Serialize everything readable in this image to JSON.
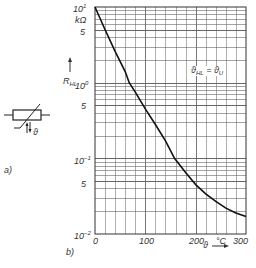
{
  "chart_data": {
    "type": "line",
    "title": "",
    "xlabel": "ϑ",
    "x_unit": "°C",
    "ylabel": "R_HL",
    "y_unit": "kΩ",
    "yscale": "log",
    "xlim": [
      0,
      300
    ],
    "ylim": [
      0.01,
      10
    ],
    "grid": true,
    "x_ticks": [
      "0",
      "100",
      "200",
      "300"
    ],
    "y_ticks": [
      "10^1",
      "5",
      "10^0",
      "5",
      "10^-1",
      "5",
      "10^-2"
    ],
    "annotation": "ϑHL = ϑU",
    "series": [
      {
        "name": "R_HL",
        "x": [
          0,
          20,
          40,
          60,
          68,
          80,
          100,
          120,
          140,
          158,
          180,
          200,
          220,
          240,
          260,
          280,
          300
        ],
        "y": [
          10,
          5.0,
          2.6,
          1.4,
          1.0,
          0.75,
          0.45,
          0.28,
          0.17,
          0.1,
          0.065,
          0.045,
          0.034,
          0.027,
          0.022,
          0.019,
          0.017
        ]
      }
    ]
  },
  "labels": {
    "y_top_exp": "10",
    "y_top_sup": "1",
    "y_unit": "kΩ",
    "y_5a": "5",
    "y_axis_name": "R",
    "y_axis_sub": "HL",
    "y_mid_exp": "10",
    "y_mid_sup": "0",
    "y_5b": "5",
    "y_low_exp": "10",
    "y_low_sup": "−1",
    "y_5c": "5",
    "y_bot_exp": "10",
    "y_bot_sup": "−2",
    "x0": "0",
    "x100": "100",
    "x200": "200",
    "x_unit": "°C",
    "x300": "300",
    "x_axis_name": "ϑ",
    "annot_main": "ϑ",
    "annot_sub1": "HL",
    "annot_eq": " = ϑ",
    "annot_sub2": "U",
    "panel_a": "a)",
    "panel_b": "b)",
    "symbol_theta": "ϑ"
  }
}
